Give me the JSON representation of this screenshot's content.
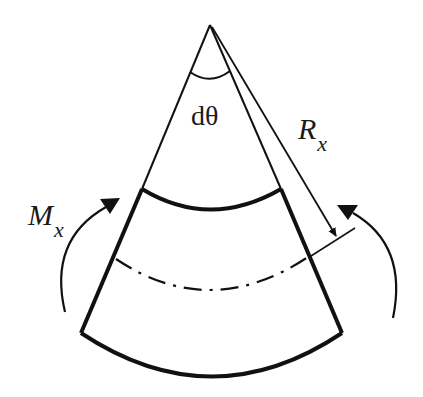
{
  "diagram": {
    "labels": {
      "angle": "dθ",
      "radius_main": "R",
      "radius_sub": "x",
      "moment_main": "M",
      "moment_sub": "x"
    },
    "colors": {
      "stroke": "#111111",
      "background": "#ffffff"
    }
  }
}
